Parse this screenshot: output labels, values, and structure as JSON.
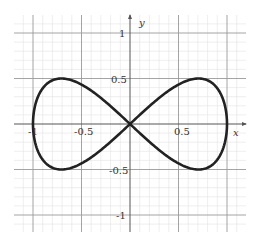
{
  "chart_data": {
    "type": "line",
    "title": "",
    "xlabel": "x",
    "ylabel": "y",
    "xlim": [
      -1.2,
      1.2
    ],
    "ylim": [
      -1.2,
      1.2
    ],
    "grid": true,
    "major_grid_step": 0.5,
    "minor_grid_step": 0.1,
    "legend": null,
    "x_ticks": [
      -1,
      -0.5,
      0.5,
      1
    ],
    "x_tick_labels": [
      "-1",
      "-0.5",
      "0.5",
      ""
    ],
    "y_ticks": [
      1,
      0.5,
      -0.5,
      -1
    ],
    "y_tick_labels": [
      "1",
      "0.5",
      "-0.5",
      "-1"
    ],
    "series": [
      {
        "name": "lemniscate of Gerono",
        "equation": "x^4 = x^2 - y^2",
        "parametric": "x = cos(t), y = sin(t)cos(t)",
        "color": "#222222",
        "points": [
          [
            1.0,
            0.0
          ],
          [
            0.95,
            0.3
          ],
          [
            0.85,
            0.45
          ],
          [
            0.707,
            0.5
          ],
          [
            0.5,
            0.433
          ],
          [
            0.25,
            0.242
          ],
          [
            0.0,
            0.0
          ],
          [
            -0.25,
            -0.242
          ],
          [
            -0.5,
            -0.433
          ],
          [
            -0.707,
            -0.5
          ],
          [
            -0.85,
            -0.45
          ],
          [
            -0.95,
            -0.3
          ],
          [
            -1.0,
            0.0
          ],
          [
            -0.95,
            0.3
          ],
          [
            -0.85,
            0.45
          ],
          [
            -0.707,
            0.5
          ],
          [
            -0.5,
            0.433
          ],
          [
            -0.25,
            0.242
          ],
          [
            0.0,
            0.0
          ],
          [
            0.25,
            -0.242
          ],
          [
            0.5,
            -0.433
          ],
          [
            0.707,
            -0.5
          ],
          [
            0.85,
            -0.45
          ],
          [
            0.95,
            -0.3
          ],
          [
            1.0,
            0.0
          ]
        ]
      }
    ]
  },
  "axes": {
    "x_label": "x",
    "y_label": "y",
    "x_tick_neg1": "-1",
    "x_tick_neg05": "-0.5",
    "x_tick_05": "0.5",
    "y_tick_1": "1",
    "y_tick_05": "0.5",
    "y_tick_neg05": "-0.5",
    "y_tick_neg1": "-1"
  },
  "colors": {
    "curve": "#222222",
    "axis": "#555555",
    "major_grid": "#9a9a9a",
    "minor_grid": "#e2e2e2"
  }
}
